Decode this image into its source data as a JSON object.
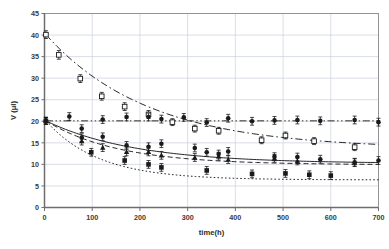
{
  "chart_data": {
    "type": "scatter",
    "title": "",
    "xlabel": "time(h)",
    "ylabel": "V (μl)",
    "xlim": [
      0,
      700
    ],
    "ylim": [
      0,
      45
    ],
    "xticks": [
      0,
      100,
      200,
      300,
      400,
      500,
      600,
      700
    ],
    "yticks": [
      0,
      5,
      10,
      15,
      20,
      25,
      30,
      35,
      40,
      45
    ],
    "grid": true,
    "legend": "none",
    "error_bars": true,
    "colors": {
      "ink": "#1a1a1a",
      "grid": "#c9cfdc",
      "axis": "#808080"
    },
    "series": [
      {
        "name": "open-square-decay",
        "marker": "open-square",
        "line": "dash-dot",
        "x": [
          3,
          30,
          75,
          120,
          168,
          218,
          268,
          315,
          365,
          455,
          505,
          565,
          650
        ],
        "values": [
          40.1,
          35.4,
          29.9,
          25.8,
          23.4,
          21.6,
          19.8,
          18.3,
          17.8,
          15.6,
          16.7,
          15.4,
          14.0
        ],
        "errors": [
          0.9,
          1.0,
          0.9,
          0.9,
          0.9,
          0.9,
          0.8,
          0.8,
          0.8,
          0.8,
          0.8,
          0.8,
          0.8
        ],
        "fit": {
          "kind": "exponential",
          "y0": 40.1,
          "yinf": 13.6,
          "tau": 215
        }
      },
      {
        "name": "filled-circle-flat",
        "marker": "filled-circle",
        "line": "dash-dot-dot",
        "x": [
          3,
          52,
          78,
          122,
          172,
          218,
          245,
          292,
          340,
          385,
          435,
          482,
          530,
          578,
          650,
          700
        ],
        "values": [
          20.1,
          21.1,
          18.3,
          20.4,
          21.0,
          21.0,
          20.5,
          20.9,
          19.7,
          20.7,
          20.0,
          20.2,
          20.3,
          20.1,
          20.3,
          19.8
        ],
        "errors": [
          0.8,
          0.9,
          0.9,
          0.9,
          0.9,
          0.9,
          0.9,
          0.9,
          0.9,
          0.9,
          0.9,
          0.9,
          0.9,
          0.9,
          0.9,
          0.9
        ],
        "fit": {
          "kind": "constant",
          "y0": 20.1,
          "yinf": 20.1,
          "tau": 1
        }
      },
      {
        "name": "filled-circle-mid-decay",
        "marker": "filled-circle",
        "line": "solid",
        "x": [
          3,
          78,
          122,
          172,
          218,
          245,
          315,
          340,
          365,
          385,
          482,
          530,
          578,
          650,
          700
        ],
        "values": [
          20.1,
          16.2,
          16.4,
          14.4,
          14.1,
          14.8,
          13.8,
          12.8,
          12.4,
          13.0,
          11.8,
          11.7,
          11.2,
          10.5,
          10.9
        ],
        "errors": [
          0.8,
          0.9,
          0.9,
          0.9,
          0.9,
          0.9,
          0.9,
          0.9,
          0.9,
          0.9,
          0.9,
          0.9,
          0.9,
          0.9,
          0.9
        ],
        "fit": {
          "kind": "exponential",
          "y0": 20.1,
          "yinf": 10.2,
          "tau": 185
        }
      },
      {
        "name": "filled-triangle-decay",
        "marker": "filled-triangle",
        "line": "dashed",
        "x": [
          3,
          78,
          122,
          172,
          218,
          245,
          315,
          365,
          385,
          482,
          530,
          650
        ],
        "values": [
          20.1,
          15.4,
          13.9,
          12.9,
          12.9,
          12.1,
          11.6,
          11.9,
          11.1,
          11.4,
          10.8,
          10.4
        ],
        "errors": [
          0.8,
          0.9,
          0.9,
          0.9,
          0.9,
          0.9,
          0.9,
          0.9,
          0.9,
          0.9,
          0.9,
          0.9
        ],
        "fit": {
          "kind": "exponential",
          "y0": 20.1,
          "yinf": 9.9,
          "tau": 150
        }
      },
      {
        "name": "filled-square-low-decay",
        "marker": "filled-square",
        "line": "dotted",
        "x": [
          3,
          98,
          168,
          218,
          245,
          340,
          435,
          505,
          555,
          600
        ],
        "values": [
          20.1,
          12.8,
          10.9,
          10.0,
          9.3,
          8.6,
          7.8,
          7.9,
          7.6,
          7.4
        ],
        "errors": [
          0.8,
          0.9,
          0.9,
          0.9,
          0.9,
          0.9,
          0.9,
          0.9,
          0.9,
          0.9
        ],
        "fit": {
          "kind": "exponential",
          "y0": 20.1,
          "yinf": 6.4,
          "tau": 110
        }
      }
    ]
  }
}
